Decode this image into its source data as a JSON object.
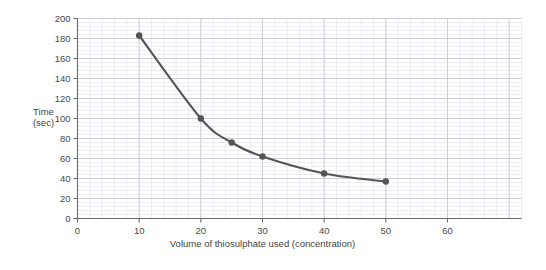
{
  "chart_data": {
    "type": "line",
    "title": "",
    "xlabel": "Volume of thiosulphate used (concentration)",
    "ylabel": "Time (sec)",
    "ylabel_line1": "Time",
    "ylabel_line2": "(sec)",
    "xlim": [
      0,
      60
    ],
    "ylim": [
      0,
      200
    ],
    "xticks": [
      0,
      10,
      20,
      30,
      40,
      50,
      60
    ],
    "yticks": [
      0,
      20,
      40,
      60,
      80,
      100,
      120,
      140,
      160,
      180,
      200
    ],
    "xtick_labels": [
      "0",
      "10",
      "20",
      "30",
      "40",
      "50",
      "60"
    ],
    "ytick_labels": [
      "0",
      "20",
      "40",
      "60",
      "80",
      "100",
      "120",
      "140",
      "160",
      "180",
      "200"
    ],
    "x": [
      10,
      20,
      25,
      30,
      40,
      50
    ],
    "values": [
      183,
      100,
      76,
      62,
      45,
      37
    ],
    "points": [
      {
        "x": 10,
        "y": 183
      },
      {
        "x": 20,
        "y": 100
      },
      {
        "x": 25,
        "y": 76
      },
      {
        "x": 30,
        "y": 62
      },
      {
        "x": 40,
        "y": 45
      },
      {
        "x": 50,
        "y": 37
      }
    ],
    "grid": true,
    "grid_minor_x_step": 2,
    "grid_minor_y_step": 4,
    "grid_major_x_step": 10,
    "grid_major_y_step": 20,
    "legend": null,
    "marker": "circle",
    "line_style": "smooth",
    "series_color": "#555555",
    "grid_minor_color": "#e6e9ee",
    "grid_major_color": "#c9cdd4",
    "axis_color": "#6b6b6b",
    "background_color": "#ffffff"
  }
}
